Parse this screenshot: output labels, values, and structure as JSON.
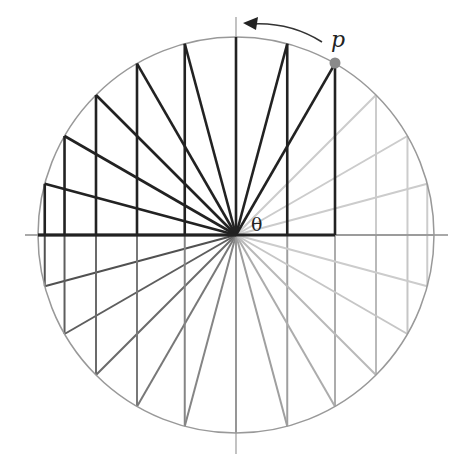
{
  "diagram": {
    "center": {
      "x": 236,
      "y": 235
    },
    "radius": 198,
    "spoke_step_deg": 15,
    "highlighted_range_deg": [
      60,
      180
    ],
    "point": {
      "label": "p",
      "angle_deg": 60,
      "color": "#8a8a8a"
    },
    "angle_label": "θ",
    "arrow_direction": "counterclockwise",
    "colors": {
      "circle": "#999999",
      "axes": "#8c8c8c",
      "dark_spoke": "#222222",
      "light_spoke": "#cccccc"
    }
  }
}
